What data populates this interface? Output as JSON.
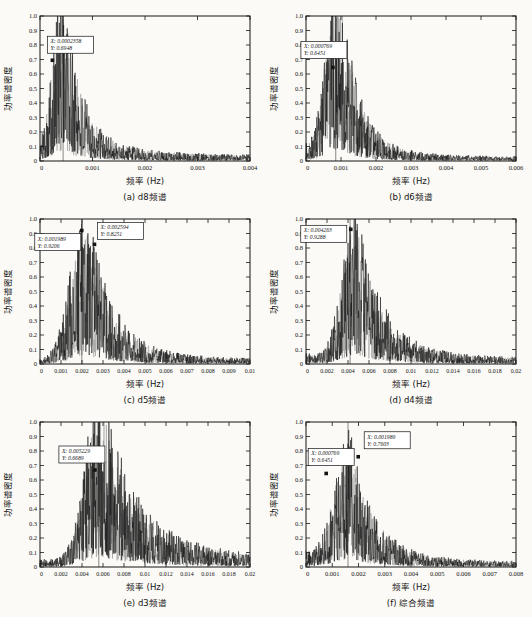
{
  "colors": {
    "ink": "#141414",
    "ink_soft": "#8a8a8a",
    "paper": "#fbfaf6",
    "annotation_bg": "#ffffff"
  },
  "chart_data": [
    {
      "type": "line",
      "caption": "(a) d8频谱",
      "xlabel": "频率 (Hz)",
      "ylabel": "功率谱密度",
      "xlim": [
        0,
        0.004
      ],
      "ylim": [
        0,
        1.0
      ],
      "grid": false,
      "legend": "none",
      "xticks": [
        0,
        0.001,
        0.002,
        0.003,
        0.004
      ],
      "xtick_labels": [
        "0",
        "0.001",
        "0.002",
        "0.003",
        "0.004"
      ],
      "yticks": [
        0,
        0.1,
        0.2,
        0.3,
        0.4,
        0.5,
        0.6,
        0.7,
        0.8,
        0.9,
        1.0
      ],
      "ytick_labels": [
        "0",
        "0.1",
        "0.2",
        "0.3",
        "0.4",
        "0.5",
        "0.6",
        "0.7",
        "0.8",
        "0.9",
        "1.0"
      ],
      "envelope_estimate": {
        "peak_x": 0.00045,
        "peak_y": 1.0,
        "rise_width": 0.0002,
        "decay": 0.00028,
        "tail_frac": 0.12,
        "tail_width": 0.001,
        "base": 0.035,
        "head": 0.0,
        "head_width": 1,
        "amp": 1.3,
        "spike_x": 0.00044,
        "seed": 101
      },
      "annotations": [
        {
          "x": 0.0002358,
          "y": 0.6948,
          "label_x": "X: 0.0002358",
          "label_y": "Y: 0.6948",
          "box_dx": -5,
          "box_dy": -24
        }
      ]
    },
    {
      "type": "line",
      "caption": "(b) d6频谱",
      "xlabel": "频率 (Hz)",
      "ylabel": "功率谱密度",
      "xlim": [
        0,
        0.006
      ],
      "ylim": [
        0,
        1.0
      ],
      "grid": false,
      "legend": "none",
      "xticks": [
        0,
        0.001,
        0.002,
        0.003,
        0.004,
        0.005,
        0.006
      ],
      "xtick_labels": [
        "0",
        "0.001",
        "0.002",
        "0.003",
        "0.004",
        "0.005",
        "0.006"
      ],
      "yticks": [
        0,
        0.1,
        0.2,
        0.3,
        0.4,
        0.5,
        0.6,
        0.7,
        0.8,
        0.9,
        1.0
      ],
      "ytick_labels": [
        "0",
        "0.1",
        "0.2",
        "0.3",
        "0.4",
        "0.5",
        "0.6",
        "0.7",
        "0.8",
        "0.9",
        "1.0"
      ],
      "envelope_estimate": {
        "peak_x": 0.00095,
        "peak_y": 1.0,
        "rise_width": 0.00035,
        "decay": 0.00045,
        "tail_frac": 0.1,
        "tail_width": 0.0013,
        "base": 0.025,
        "head": 0.07,
        "head_width": 0.0005,
        "amp": 1.35,
        "spike_x": 0.00085,
        "seed": 202
      },
      "annotations": [
        {
          "x": 0.000769,
          "y": 0.6451,
          "label_x": "X: 0.000769",
          "label_y": "Y: 0.6451",
          "box_dx": -32,
          "box_dy": -26
        }
      ]
    },
    {
      "type": "line",
      "caption": "(c) d5频谱",
      "xlabel": "频率 (Hz)",
      "ylabel": "功率谱密度",
      "xlim": [
        0,
        0.01
      ],
      "ylim": [
        0,
        1.0
      ],
      "grid": false,
      "legend": "none",
      "xticks": [
        0,
        0.001,
        0.002,
        0.003,
        0.004,
        0.005,
        0.006,
        0.007,
        0.008,
        0.009,
        0.01
      ],
      "xtick_labels": [
        "0",
        "0.001",
        "0.002",
        "0.003",
        "0.004",
        "0.005",
        "0.006",
        "0.007",
        "0.008",
        "0.009",
        "0.01"
      ],
      "yticks": [
        0,
        0.1,
        0.2,
        0.3,
        0.4,
        0.5,
        0.6,
        0.7,
        0.8,
        0.9,
        1.0
      ],
      "ytick_labels": [
        "0",
        "0.1",
        "0.2",
        "0.3",
        "0.4",
        "0.5",
        "0.6",
        "0.7",
        "0.8",
        "0.9",
        "1.0"
      ],
      "envelope_estimate": {
        "peak_x": 0.0022,
        "peak_y": 0.97,
        "rise_width": 0.0007,
        "decay": 0.0011,
        "tail_frac": 0.08,
        "tail_width": 0.003,
        "base": 0.03,
        "head": 0.0,
        "head_width": 1,
        "amp": 1.12,
        "spike_x": 0.00199,
        "seed": 303
      },
      "annotations": [
        {
          "x": 0.001989,
          "y": 0.9206,
          "label_x": "X: 0.001989",
          "label_y": "Y: 0.9206",
          "box_dx": -47,
          "box_dy": 3
        },
        {
          "x": 0.002594,
          "y": 0.8251,
          "label_x": "X: 0.002594",
          "label_y": "Y: 0.8251",
          "box_dx": 3,
          "box_dy": -22
        }
      ]
    },
    {
      "type": "line",
      "caption": "(d) d4频谱",
      "xlabel": "频率 (Hz)",
      "ylabel": "功率谱密度",
      "xlim": [
        0,
        0.02
      ],
      "ylim": [
        0,
        1.0
      ],
      "grid": false,
      "legend": "none",
      "xticks": [
        0,
        0.002,
        0.004,
        0.006,
        0.008,
        0.01,
        0.012,
        0.014,
        0.016,
        0.018,
        0.02
      ],
      "xtick_labels": [
        "0",
        "0.002",
        "0.004",
        "0.006",
        "0.008",
        "0.01",
        "0.012",
        "0.014",
        "0.016",
        "0.018",
        "0.02"
      ],
      "yticks": [
        0,
        0.1,
        0.2,
        0.3,
        0.4,
        0.5,
        0.6,
        0.7,
        0.8,
        0.9,
        1.0
      ],
      "ytick_labels": [
        "0",
        "0.1",
        "0.2",
        "0.3",
        "0.4",
        "0.5",
        "0.6",
        "0.7",
        "0.8",
        "0.9",
        "1.0"
      ],
      "envelope_estimate": {
        "peak_x": 0.0048,
        "peak_y": 0.95,
        "rise_width": 0.0013,
        "decay": 0.0022,
        "tail_frac": 0.1,
        "tail_width": 0.006,
        "base": 0.035,
        "head": 0.05,
        "head_width": 0.0012,
        "amp": 1.06,
        "spike_x": 0.0042,
        "seed": 404
      },
      "annotations": [
        {
          "x": 0.004263,
          "y": 0.9288,
          "label_x": "X: 0.004263",
          "label_y": "Y: 0.9288",
          "box_dx": -50,
          "box_dy": -4
        }
      ]
    },
    {
      "type": "line",
      "caption": "(e) d3频谱",
      "xlabel": "频率 (Hz)",
      "ylabel": "功率谱密度",
      "xlim": [
        0,
        0.02
      ],
      "ylim": [
        0,
        1.0
      ],
      "grid": false,
      "legend": "none",
      "xticks": [
        0,
        0.002,
        0.004,
        0.006,
        0.008,
        0.01,
        0.012,
        0.014,
        0.016,
        0.018,
        0.02
      ],
      "xtick_labels": [
        "0",
        "0.002",
        "0.004",
        "0.006",
        "0.008",
        "0.01",
        "0.012",
        "0.014",
        "0.016",
        "0.018",
        "0.02"
      ],
      "yticks": [
        0,
        0.1,
        0.2,
        0.3,
        0.4,
        0.5,
        0.6,
        0.7,
        0.8,
        0.9,
        1.0
      ],
      "ytick_labels": [
        "0",
        "0.1",
        "0.2",
        "0.3",
        "0.4",
        "0.5",
        "0.6",
        "0.7",
        "0.8",
        "0.9",
        "1.0"
      ],
      "envelope_estimate": {
        "peak_x": 0.0058,
        "peak_y": 1.0,
        "rise_width": 0.0014,
        "decay": 0.0026,
        "tail_frac": 0.18,
        "tail_width": 0.008,
        "base": 0.04,
        "head": 0.02,
        "head_width": 0.002,
        "amp": 1.28,
        "spike_x": 0.0056,
        "seed": 505
      },
      "annotations": [
        {
          "x": 0.005229,
          "y": 0.6689,
          "label_x": "X: 0.005229",
          "label_y": "Y: 0.6689",
          "box_dx": -36,
          "box_dy": -24
        }
      ]
    },
    {
      "type": "line",
      "caption": "(f) 综合频谱",
      "xlabel": "频率 (Hz)",
      "ylabel": "功率谱密度",
      "xlim": [
        0,
        0.008
      ],
      "ylim": [
        0,
        1.0
      ],
      "grid": false,
      "legend": "none",
      "xticks": [
        0,
        0.001,
        0.002,
        0.003,
        0.004,
        0.005,
        0.006,
        0.007,
        0.008
      ],
      "xtick_labels": [
        "0",
        "0.001",
        "0.002",
        "0.003",
        "0.004",
        "0.005",
        "0.006",
        "0.007",
        "0.008"
      ],
      "yticks": [
        0,
        0.1,
        0.2,
        0.3,
        0.4,
        0.5,
        0.6,
        0.7,
        0.8,
        0.9,
        1.0
      ],
      "ytick_labels": [
        "0",
        "0.1",
        "0.2",
        "0.3",
        "0.4",
        "0.5",
        "0.6",
        "0.7",
        "0.8",
        "0.9",
        "1.0"
      ],
      "envelope_estimate": {
        "peak_x": 0.0017,
        "peak_y": 0.85,
        "rise_width": 0.0006,
        "decay": 0.0008,
        "tail_frac": 0.12,
        "tail_width": 0.0022,
        "base": 0.03,
        "head": 0.07,
        "head_width": 0.0006,
        "amp": 0.92,
        "spike_x": 0.0016,
        "seed": 606
      },
      "annotations": [
        {
          "x": 0.000769,
          "y": 0.6451,
          "label_x": "X: 0.000769",
          "label_y": "Y: 0.6451",
          "box_dx": -18,
          "box_dy": -25
        },
        {
          "x": 0.001989,
          "y": 0.7603,
          "label_x": "X: 0.001989",
          "label_y": "Y: 0.7603",
          "box_dx": 6,
          "box_dy": -25
        }
      ]
    }
  ]
}
